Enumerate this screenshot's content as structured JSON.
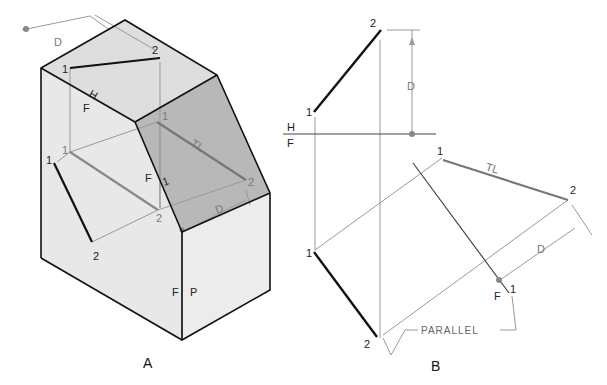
{
  "figure_a": {
    "caption": "A",
    "labels": {
      "dim_d": "D",
      "top_2": "2",
      "top_1": "1",
      "fold_h": "H",
      "fold_f": "F",
      "aux_1_top": "1",
      "aux_tl": "TL",
      "left_1a": "1",
      "left_1b": "1",
      "front_f": "F",
      "fold_1": "1",
      "aux_2": "2",
      "aux_d": "D",
      "mid_2": "2",
      "bottom_2": "2",
      "fp_f": "F",
      "fp_p": "P"
    }
  },
  "figure_b": {
    "caption": "B",
    "labels": {
      "top_2": "2",
      "dim_d": "D",
      "top_1": "1",
      "fold_h": "H",
      "fold_f": "F",
      "aux_1": "1",
      "aux_tl": "TL",
      "aux_2": "2",
      "front_1": "1",
      "aux_d": "D",
      "fold_f2": "F",
      "fold_1": "1",
      "front_2": "2",
      "parallel": "PARALLEL"
    }
  },
  "colors": {
    "face_light": "#e6e6e6",
    "face_mid": "#dcdcdc",
    "face_dark": "#b5b5b5",
    "edge": "#111111",
    "construction": "#999999"
  }
}
